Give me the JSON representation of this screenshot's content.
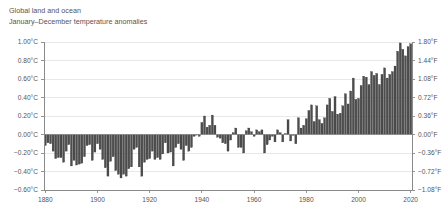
{
  "title": {
    "line1": "Global land and ocean",
    "line2": "January–December temperature anomalies"
  },
  "chart_data": {
    "type": "bar",
    "title": "Global land and ocean January–December temperature anomalies",
    "subtitle": "January–December temperature anomalies",
    "xlabel": "",
    "ylabel": "",
    "y_left_label": "Temperature anomaly (°C)",
    "y_right_label": "Temperature anomaly (°F)",
    "xlim": [
      1879.5,
      2020.5
    ],
    "ylim": [
      -0.6,
      1.0
    ],
    "ylim_right": [
      -1.08,
      1.8
    ],
    "grid": true,
    "legend": "none",
    "bar_color": "#4d4d4d",
    "bar_edge_color": "#2b2b2b",
    "axis_color": "#8a8a8a",
    "grid_color": "#e2e2e2",
    "text_color": "#555555",
    "y_left_ticks": [
      "1.00°C",
      "0.80°C",
      "0.60°C",
      "0.40°C",
      "0.20°C",
      "0.00°C",
      "−0.20°C",
      "−0.40°C",
      "−0.60°C"
    ],
    "y_left_values": [
      1.0,
      0.8,
      0.6,
      0.4,
      0.2,
      0.0,
      -0.2,
      -0.4,
      -0.6
    ],
    "y_right_ticks": [
      "1.80°F",
      "1.44°F",
      "1.08°F",
      "0.72°F",
      "0.36°F",
      "0.00°F",
      "−0.36°F",
      "−0.72°F",
      "−1.08°F"
    ],
    "y_right_values": [
      1.8,
      1.44,
      1.08,
      0.72,
      0.36,
      0.0,
      -0.36,
      -0.72,
      -1.08
    ],
    "x_ticks": [
      "1880",
      "1900",
      "1920",
      "1940",
      "1960",
      "1980",
      "2000",
      "2020"
    ],
    "x_tick_values": [
      1880,
      1900,
      1920,
      1940,
      1960,
      1980,
      2000,
      2020
    ],
    "categories": [
      1880,
      1881,
      1882,
      1883,
      1884,
      1885,
      1886,
      1887,
      1888,
      1889,
      1890,
      1891,
      1892,
      1893,
      1894,
      1895,
      1896,
      1897,
      1898,
      1899,
      1900,
      1901,
      1902,
      1903,
      1904,
      1905,
      1906,
      1907,
      1908,
      1909,
      1910,
      1911,
      1912,
      1913,
      1914,
      1915,
      1916,
      1917,
      1918,
      1919,
      1920,
      1921,
      1922,
      1923,
      1924,
      1925,
      1926,
      1927,
      1928,
      1929,
      1930,
      1931,
      1932,
      1933,
      1934,
      1935,
      1936,
      1937,
      1938,
      1939,
      1940,
      1941,
      1942,
      1943,
      1944,
      1945,
      1946,
      1947,
      1948,
      1949,
      1950,
      1951,
      1952,
      1953,
      1954,
      1955,
      1956,
      1957,
      1958,
      1959,
      1960,
      1961,
      1962,
      1963,
      1964,
      1965,
      1966,
      1967,
      1968,
      1969,
      1970,
      1971,
      1972,
      1973,
      1974,
      1975,
      1976,
      1977,
      1978,
      1979,
      1980,
      1981,
      1982,
      1983,
      1984,
      1985,
      1986,
      1987,
      1988,
      1989,
      1990,
      1991,
      1992,
      1993,
      1994,
      1995,
      1996,
      1997,
      1998,
      1999,
      2000,
      2001,
      2002,
      2003,
      2004,
      2005,
      2006,
      2007,
      2008,
      2009,
      2010,
      2011,
      2012,
      2013,
      2014,
      2015,
      2016,
      2017,
      2018,
      2019,
      2020
    ],
    "values": [
      -0.12,
      -0.09,
      -0.1,
      -0.18,
      -0.26,
      -0.25,
      -0.25,
      -0.3,
      -0.18,
      -0.11,
      -0.34,
      -0.28,
      -0.33,
      -0.32,
      -0.31,
      -0.24,
      -0.12,
      -0.11,
      -0.28,
      -0.19,
      -0.1,
      -0.16,
      -0.27,
      -0.36,
      -0.45,
      -0.29,
      -0.24,
      -0.39,
      -0.43,
      -0.47,
      -0.43,
      -0.45,
      -0.37,
      -0.35,
      -0.16,
      -0.14,
      -0.35,
      -0.45,
      -0.3,
      -0.27,
      -0.26,
      -0.18,
      -0.27,
      -0.25,
      -0.27,
      -0.21,
      -0.09,
      -0.2,
      -0.19,
      -0.34,
      -0.14,
      -0.1,
      -0.16,
      -0.28,
      -0.12,
      -0.18,
      -0.14,
      -0.02,
      0.0,
      -0.02,
      0.13,
      0.2,
      0.08,
      0.1,
      0.21,
      0.1,
      -0.03,
      -0.04,
      -0.09,
      -0.1,
      -0.18,
      -0.06,
      0.02,
      0.07,
      -0.14,
      -0.14,
      -0.2,
      0.04,
      0.07,
      0.03,
      -0.02,
      0.05,
      0.03,
      0.05,
      -0.2,
      -0.11,
      -0.06,
      -0.02,
      -0.08,
      0.05,
      0.02,
      -0.08,
      0.01,
      0.16,
      -0.07,
      -0.01,
      -0.1,
      0.18,
      0.07,
      0.1,
      0.17,
      0.26,
      0.32,
      0.14,
      0.31,
      0.16,
      0.12,
      0.18,
      0.32,
      0.39,
      0.25,
      0.41,
      0.22,
      0.23,
      0.31,
      0.44,
      0.33,
      0.47,
      0.61,
      0.38,
      0.39,
      0.53,
      0.63,
      0.62,
      0.54,
      0.68,
      0.64,
      0.66,
      0.54,
      0.65,
      0.72,
      0.61,
      0.65,
      0.68,
      0.74,
      0.9,
      0.99,
      0.92,
      0.85,
      0.95,
      0.98
    ]
  }
}
